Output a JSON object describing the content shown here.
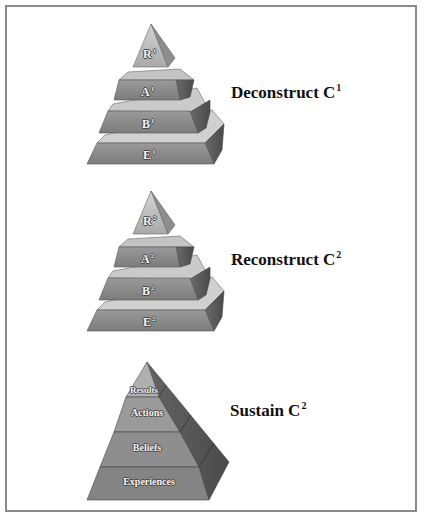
{
  "figure": {
    "panels": [
      {
        "caption": "Deconstruct C",
        "caption_sup": "1",
        "tiers": [
          {
            "label": "R",
            "sup": "1"
          },
          {
            "label": "A",
            "sup": "1"
          },
          {
            "label": "B",
            "sup": "1"
          },
          {
            "label": "E",
            "sup": "1"
          }
        ]
      },
      {
        "caption": "Reconstruct C",
        "caption_sup": "2",
        "tiers": [
          {
            "label": "R",
            "sup": "2"
          },
          {
            "label": "A",
            "sup": "2"
          },
          {
            "label": "B",
            "sup": "2"
          },
          {
            "label": "E",
            "sup": "2"
          }
        ]
      },
      {
        "caption": "Sustain C",
        "caption_sup": "2",
        "tiers": [
          {
            "label": "Results"
          },
          {
            "label": "Actions"
          },
          {
            "label": "Beliefs"
          },
          {
            "label": "Experiences"
          }
        ]
      }
    ],
    "colors": {
      "front": "#8c8c8c",
      "top": "#c8c8c8",
      "cap_front": "#b5b5b5",
      "side": "#5a5a5a",
      "frame": "#8a8a8a"
    }
  }
}
